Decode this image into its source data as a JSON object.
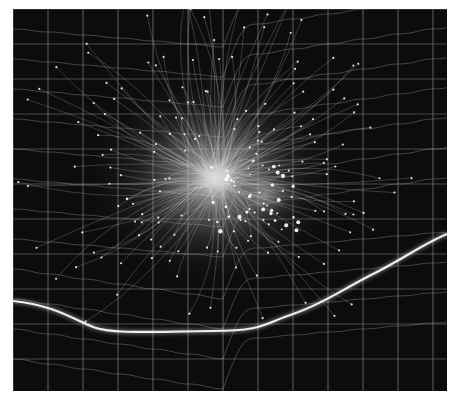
{
  "artwork": {
    "subject": "abstract digital artwork: glowing grid with radiating filaments",
    "palette": {
      "background": "#0c0c0c",
      "frame": "#ffffff",
      "grid": "#9a9a9a",
      "glow": "#f2f2f2",
      "filament": "#cfcfcf"
    },
    "canvas": {
      "x": 13,
      "y": 9,
      "width": 434,
      "height": 382
    },
    "glow_center": {
      "x": 202,
      "y": 169
    },
    "secondary_glow": {
      "x": 252,
      "y": 186
    },
    "grid_spacing": 35
  }
}
